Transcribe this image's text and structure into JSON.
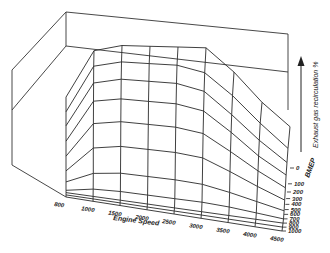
{
  "chart_data": {
    "type": "surface3d",
    "title": "",
    "xlabel": "Engine Speed",
    "ylabel": "BMEP",
    "zlabel": "Exhaust gas recirculation %",
    "x_ticks": [
      "800",
      "1000",
      "1500",
      "2000",
      "2500",
      "3000",
      "3500",
      "4000",
      "4500"
    ],
    "y_ticks": [
      "0",
      "100",
      "200",
      "300",
      "400",
      "500",
      "600",
      "700",
      "800",
      "900",
      "1000"
    ],
    "x": [
      800,
      1000,
      1500,
      2000,
      2500,
      3000,
      3500,
      4000,
      4500
    ],
    "y": [
      0,
      100,
      200,
      300,
      400,
      500,
      600,
      700,
      800,
      900,
      1000
    ],
    "z_relative": [
      [
        0.55,
        0.95,
        1.0,
        1.0,
        1.0,
        1.0,
        0.8,
        0.55,
        0.35
      ],
      [
        0.5,
        0.9,
        0.95,
        0.95,
        0.95,
        0.9,
        0.72,
        0.5,
        0.3
      ],
      [
        0.42,
        0.8,
        0.85,
        0.85,
        0.85,
        0.8,
        0.62,
        0.42,
        0.25
      ],
      [
        0.32,
        0.68,
        0.72,
        0.72,
        0.72,
        0.68,
        0.52,
        0.34,
        0.2
      ],
      [
        0.22,
        0.52,
        0.56,
        0.56,
        0.56,
        0.53,
        0.4,
        0.26,
        0.14
      ],
      [
        0.12,
        0.34,
        0.38,
        0.38,
        0.38,
        0.36,
        0.27,
        0.17,
        0.08
      ],
      [
        0.05,
        0.15,
        0.18,
        0.18,
        0.18,
        0.17,
        0.13,
        0.08,
        0.03
      ],
      [
        0.0,
        0.04,
        0.05,
        0.05,
        0.05,
        0.05,
        0.04,
        0.02,
        0.0
      ],
      [
        0.0,
        0.0,
        0.0,
        0.0,
        0.0,
        0.0,
        0.0,
        0.0,
        0.0
      ],
      [
        0.0,
        0.0,
        0.0,
        0.0,
        0.0,
        0.0,
        0.0,
        0.0,
        0.0
      ],
      [
        0.0,
        0.0,
        0.0,
        0.0,
        0.0,
        0.0,
        0.0,
        0.0,
        0.0
      ]
    ],
    "grid": true,
    "legend": null
  }
}
